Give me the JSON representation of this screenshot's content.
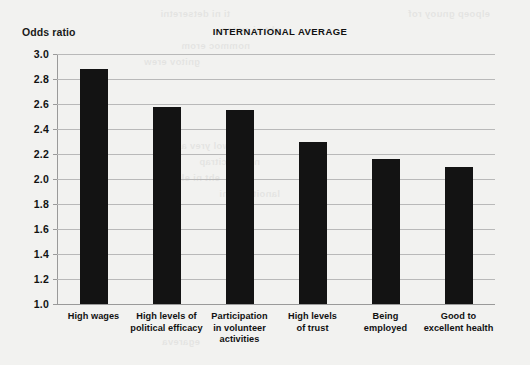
{
  "chart_data": {
    "type": "bar",
    "title": "INTERNATIONAL AVERAGE",
    "ylabel": "Odds ratio",
    "xlabel": "",
    "ylim": [
      1.0,
      3.0
    ],
    "yticks": [
      "1.0",
      "1.2",
      "1.4",
      "1.6",
      "1.8",
      "2.0",
      "2.2",
      "2.4",
      "2.6",
      "2.8",
      "3.0"
    ],
    "ytick_values": [
      1.0,
      1.2,
      1.4,
      1.6,
      1.8,
      2.0,
      2.2,
      2.4,
      2.6,
      2.8,
      3.0
    ],
    "grid": true,
    "legend": "none",
    "bar_color": "#131313",
    "categories": [
      "High wages",
      "High levels of political efficacy",
      "Participation in volunteer activities",
      "High levels of trust",
      "Being employed",
      "Good to excellent health"
    ],
    "category_lines": [
      [
        "High wages"
      ],
      [
        "High levels of",
        "political efficacy"
      ],
      [
        "Participation",
        "in volunteer",
        "activities"
      ],
      [
        "High levels",
        "of trust"
      ],
      [
        "Being",
        "employed"
      ],
      [
        "Good to",
        "excellent health"
      ]
    ],
    "values": [
      2.88,
      2.58,
      2.55,
      2.3,
      2.16,
      2.1
    ]
  }
}
